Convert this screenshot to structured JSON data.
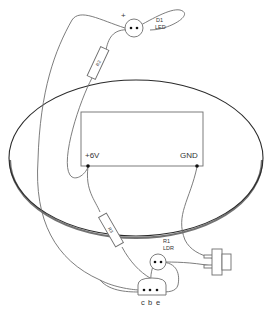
{
  "diagram": {
    "type": "circuit-wiring",
    "background": "#ffffff",
    "line_color": "#6e6e6e",
    "board": {
      "shape": "ellipse",
      "outline_color": "#2a2a2a"
    },
    "battery_box": {
      "terminals": [
        {
          "label": "+6V"
        },
        {
          "label": "GND"
        }
      ]
    },
    "components": {
      "led": {
        "designator": "D1",
        "type": "LED",
        "polarity_mark": "+"
      },
      "resistor_top": {
        "designator": "R2"
      },
      "resistor_bottom": {
        "designator": "R3"
      },
      "ldr": {
        "designator": "R1",
        "type": "LDR"
      },
      "transistor": {
        "pins": [
          "c",
          "b",
          "e"
        ]
      },
      "switch": {
        "type": "push-switch"
      }
    }
  }
}
